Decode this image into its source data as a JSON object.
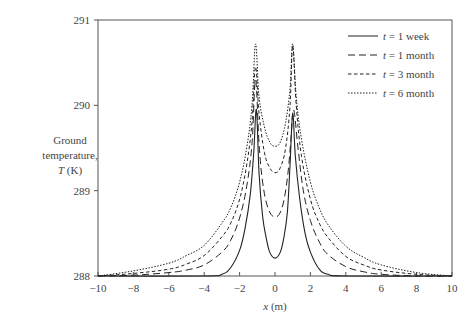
{
  "chart_data": {
    "type": "line",
    "title": "",
    "xlabel": "x (m)",
    "xlabel_var": "x",
    "xlabel_unit": " (m)",
    "ylabel_lines": [
      "Ground",
      "temperature,"
    ],
    "ylabel_var": "T",
    "ylabel_unit": " (K)",
    "xlim": [
      -10,
      10
    ],
    "ylim": [
      288,
      291
    ],
    "xticks": [
      -10,
      -8,
      -6,
      -4,
      -2,
      0,
      2,
      4,
      6,
      8,
      10
    ],
    "xtick_labels": [
      "−10",
      "−8",
      "−6",
      "−4",
      "−2",
      "0",
      "2",
      "4",
      "6",
      "8",
      "10"
    ],
    "yticks": [
      288,
      289,
      290,
      291
    ],
    "ytick_labels": [
      "288",
      "289",
      "290",
      "291"
    ],
    "grid": false,
    "legend_position": "upper right",
    "series": [
      {
        "name": "t = 1 week",
        "legend_var": "t",
        "legend_rest": " = 1 week",
        "dash": "",
        "x": [
          -10,
          -4,
          -3,
          -2.5,
          -2,
          -1.7,
          -1.4,
          -1.2,
          -1.05,
          -0.9,
          -0.7,
          -0.5,
          -0.3,
          0,
          0.3,
          0.5,
          0.7,
          0.85,
          1.0,
          1.15,
          1.4,
          1.7,
          2,
          2.5,
          3,
          4,
          10
        ],
        "values": [
          288.0,
          288.0,
          288.02,
          288.1,
          288.3,
          288.55,
          288.95,
          289.45,
          289.95,
          289.2,
          288.7,
          288.45,
          288.28,
          288.21,
          288.28,
          288.45,
          288.75,
          289.3,
          289.9,
          289.4,
          288.9,
          288.5,
          288.28,
          288.08,
          288.02,
          288.0,
          288.0
        ]
      },
      {
        "name": "t = 1 month",
        "legend_var": "t",
        "legend_rest": " = 1 month",
        "dash": "7,4",
        "x": [
          -10,
          -8,
          -6,
          -5,
          -4,
          -3,
          -2.5,
          -2,
          -1.6,
          -1.3,
          -1.1,
          -0.9,
          -0.7,
          -0.4,
          0,
          0.4,
          0.7,
          0.9,
          1.05,
          1.3,
          1.6,
          2,
          2.5,
          3,
          4,
          5,
          6,
          8,
          10
        ],
        "values": [
          288.0,
          288.01,
          288.04,
          288.07,
          288.13,
          288.28,
          288.42,
          288.68,
          289.05,
          289.55,
          290.3,
          289.55,
          289.1,
          288.8,
          288.69,
          288.8,
          289.15,
          289.6,
          289.95,
          289.5,
          289.0,
          288.65,
          288.4,
          288.25,
          288.11,
          288.05,
          288.02,
          288.0,
          288.0
        ]
      },
      {
        "name": "t = 3 month",
        "legend_var": "t",
        "legend_rest": " = 3 month",
        "dash": "3.5,2.5",
        "x": [
          -10,
          -8,
          -6,
          -5,
          -4,
          -3,
          -2.5,
          -2,
          -1.6,
          -1.3,
          -1.1,
          -0.9,
          -0.6,
          -0.3,
          0,
          0.3,
          0.6,
          0.85,
          1.0,
          1.2,
          1.5,
          2,
          2.5,
          3,
          4,
          5,
          6,
          8,
          10
        ],
        "values": [
          288.0,
          288.03,
          288.08,
          288.14,
          288.24,
          288.46,
          288.62,
          288.9,
          289.3,
          289.8,
          290.45,
          289.9,
          289.45,
          289.27,
          289.21,
          289.27,
          289.5,
          290.0,
          290.7,
          290.0,
          289.4,
          288.9,
          288.62,
          288.45,
          288.23,
          288.13,
          288.07,
          288.02,
          288.0
        ]
      },
      {
        "name": "t = 6 month",
        "legend_var": "t",
        "legend_rest": " = 6 month",
        "dash": "1.5,1.5",
        "x": [
          -10,
          -8,
          -6,
          -5,
          -4,
          -3,
          -2.5,
          -2,
          -1.6,
          -1.3,
          -1.1,
          -0.9,
          -0.6,
          -0.3,
          0,
          0.3,
          0.6,
          0.85,
          1.0,
          1.2,
          1.5,
          2,
          2.5,
          3,
          4,
          5,
          6,
          8,
          10
        ],
        "values": [
          288.0,
          288.06,
          288.15,
          288.24,
          288.36,
          288.62,
          288.8,
          289.1,
          289.5,
          290.0,
          290.72,
          290.1,
          289.75,
          289.57,
          289.52,
          289.57,
          289.8,
          290.2,
          290.72,
          290.1,
          289.6,
          289.1,
          288.8,
          288.6,
          288.35,
          288.22,
          288.13,
          288.04,
          288.0
        ]
      }
    ]
  }
}
